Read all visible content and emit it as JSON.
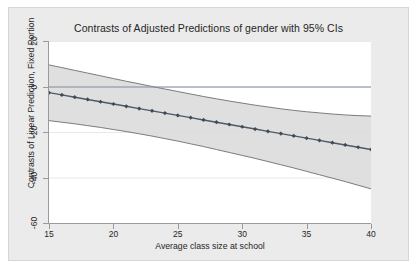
{
  "chart_data": {
    "type": "line",
    "title": "Contrasts of Adjusted Predictions of gender with 95% CIs",
    "xlabel": "Average class size at school",
    "ylabel": "Contrasts of Linear Prediction, Fixed Portion",
    "xlim": [
      15,
      40
    ],
    "ylim": [
      -60,
      20
    ],
    "xticks": [
      15,
      20,
      25,
      30,
      35,
      40
    ],
    "yticks": [
      20,
      0,
      -20,
      -40,
      -60
    ],
    "xtick_labels": [
      "15",
      "20",
      "25",
      "30",
      "35",
      "40"
    ],
    "ytick_labels": [
      "20",
      "0",
      "-20",
      "-40",
      "-60"
    ],
    "grid": true,
    "legend": "none",
    "reference_line_y": 0,
    "marker": "diamond",
    "series": [
      {
        "name": "Contrast of linear prediction",
        "x": [
          15,
          16,
          17,
          18,
          19,
          20,
          21,
          22,
          23,
          24,
          25,
          26,
          27,
          28,
          29,
          30,
          31,
          32,
          33,
          34,
          35,
          36,
          37,
          38,
          39,
          40
        ],
        "values": [
          -2.7,
          -3.7,
          -4.7,
          -5.7,
          -6.7,
          -7.7,
          -8.7,
          -9.7,
          -10.7,
          -11.7,
          -12.7,
          -13.7,
          -14.7,
          -15.7,
          -16.7,
          -17.7,
          -18.7,
          -19.7,
          -20.7,
          -21.7,
          -22.7,
          -23.7,
          -24.7,
          -25.7,
          -26.7,
          -27.7
        ]
      }
    ],
    "ci": {
      "level": "95%",
      "x": [
        15,
        16,
        17,
        18,
        19,
        20,
        21,
        22,
        23,
        24,
        25,
        26,
        27,
        28,
        29,
        30,
        31,
        32,
        33,
        34,
        35,
        36,
        37,
        38,
        39,
        40
      ],
      "upper": [
        9.5,
        8.3,
        7.1,
        5.9,
        4.7,
        3.5,
        2.3,
        1.2,
        0.0,
        -1.1,
        -2.2,
        -3.3,
        -4.4,
        -5.4,
        -6.4,
        -7.3,
        -8.2,
        -9.0,
        -9.8,
        -10.5,
        -11.1,
        -11.6,
        -12.1,
        -12.5,
        -12.8,
        -13.0
      ],
      "lower": [
        -15.0,
        -15.7,
        -16.4,
        -17.2,
        -18.0,
        -18.9,
        -19.8,
        -20.8,
        -21.8,
        -22.9,
        -24.0,
        -25.2,
        -26.4,
        -27.7,
        -29.0,
        -30.3,
        -31.6,
        -33.0,
        -34.4,
        -35.8,
        -37.3,
        -38.8,
        -40.3,
        -41.8,
        -43.4,
        -45.0
      ]
    },
    "colors": {
      "line": "#4e5a66",
      "marker": "#3f4a55",
      "ci_fill": "#d9d9d9",
      "ci_edge": "#6e6e6e",
      "reference_line": "#7f8c99",
      "grid": "#e8e8e8",
      "plot_background": "#ffffff",
      "figure_background": "#ebebeb",
      "axis": "#9a9a9a",
      "text": "#262626"
    }
  }
}
